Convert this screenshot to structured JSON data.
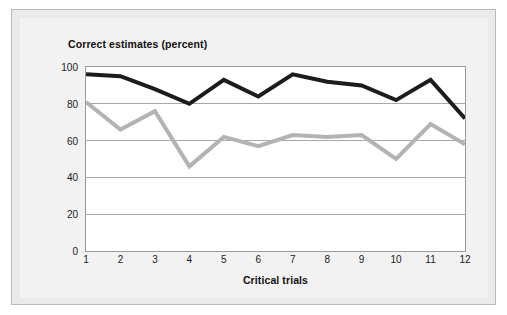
{
  "figure": {
    "title": "Correct estimates (percent)",
    "background_color": "#eaeaea",
    "panel_color": "#f2f2f2",
    "plot_background_color": "#ffffff",
    "border_color": "#b9b9b9"
  },
  "chart_data": {
    "type": "line",
    "title": "Correct estimates (percent)",
    "xlabel": "Critical trials",
    "ylabel": "",
    "categories": [
      "1",
      "2",
      "3",
      "4",
      "5",
      "6",
      "7",
      "8",
      "9",
      "10",
      "11",
      "12"
    ],
    "x": [
      1,
      2,
      3,
      4,
      5,
      6,
      7,
      8,
      9,
      10,
      11,
      12
    ],
    "ylim": [
      0,
      100
    ],
    "xlim": [
      1,
      12
    ],
    "yticks": [
      0,
      20,
      40,
      60,
      80,
      100
    ],
    "ytick_labels": [
      "0",
      "20",
      "40",
      "60",
      "80",
      "100"
    ],
    "xticks": [
      1,
      2,
      3,
      4,
      5,
      6,
      7,
      8,
      9,
      10,
      11,
      12
    ],
    "xtick_labels": [
      "1",
      "2",
      "3",
      "4",
      "5",
      "6",
      "7",
      "8",
      "9",
      "10",
      "11",
      "12"
    ],
    "grid": "horizontal",
    "grid_color": "#a8a8a8",
    "legend": "none",
    "series": [
      {
        "name": "black-series",
        "color": "#1c1c1c",
        "line_width": 4,
        "values": [
          96,
          95,
          88,
          80,
          93,
          84,
          96,
          92,
          90,
          82,
          93,
          72
        ]
      },
      {
        "name": "gray-series",
        "color": "#b3b3b3",
        "line_width": 4,
        "values": [
          81,
          66,
          76,
          46,
          62,
          57,
          63,
          62,
          63,
          50,
          69,
          58
        ]
      }
    ]
  }
}
